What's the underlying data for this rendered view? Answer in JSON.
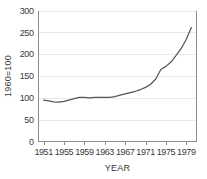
{
  "chart_data": {
    "type": "line",
    "title": "",
    "subtitle": "",
    "xlabel": "YEAR",
    "ylabel": "1960=100",
    "xlim": [
      1950,
      1981
    ],
    "ylim": [
      0,
      300
    ],
    "xticks": [
      1951,
      1955,
      1959,
      1963,
      1967,
      1971,
      1975,
      1979
    ],
    "xtick_labels": [
      "1951",
      "1955",
      "1959",
      "1963",
      "1967",
      "1971",
      "1975",
      "1979"
    ],
    "yticks": [
      0,
      50,
      100,
      150,
      200,
      250,
      300
    ],
    "ytick_labels": [
      "0",
      "50",
      "100",
      "150",
      "200",
      "250",
      "300"
    ],
    "grid": "horizontal",
    "legend": "none",
    "line_color": "#555555",
    "grid_color": "#e9e9e9",
    "axis_color": "#8d8d8d",
    "background_color": "#ffffff",
    "x": [
      1951,
      1952,
      1953,
      1954,
      1955,
      1956,
      1957,
      1958,
      1959,
      1960,
      1961,
      1962,
      1963,
      1964,
      1965,
      1966,
      1967,
      1968,
      1969,
      1970,
      1971,
      1972,
      1973,
      1974,
      1975,
      1976,
      1977,
      1978,
      1979,
      1980
    ],
    "values": [
      95,
      93,
      91,
      90,
      92,
      95,
      98,
      101,
      101,
      100,
      101,
      101,
      101,
      101,
      103,
      106,
      109,
      112,
      115,
      119,
      124,
      131,
      143,
      165,
      172,
      182,
      197,
      213,
      234,
      261
    ],
    "series": [
      {
        "name": "index",
        "values": [
          95,
          93,
          91,
          90,
          92,
          95,
          98,
          101,
          101,
          100,
          101,
          101,
          101,
          101,
          103,
          106,
          109,
          112,
          115,
          119,
          124,
          131,
          143,
          165,
          172,
          182,
          197,
          213,
          234,
          261
        ]
      }
    ],
    "annotations": []
  }
}
